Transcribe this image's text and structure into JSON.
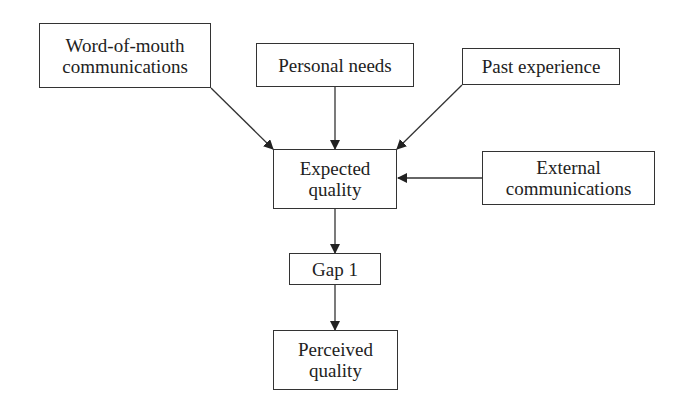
{
  "diagram": {
    "title": "",
    "colors": {
      "stroke": "#333333",
      "text": "#222222",
      "background": "#ffffff"
    },
    "nodes": {
      "word_of_mouth": {
        "label": "Word-of-mouth\ncommunications"
      },
      "personal_needs": {
        "label": "Personal needs"
      },
      "past_experience": {
        "label": "Past experience"
      },
      "expected_quality": {
        "label": "Expected\nquality"
      },
      "external_communications": {
        "label": "External\ncommunications"
      },
      "gap1": {
        "label": "Gap 1"
      },
      "perceived_quality": {
        "label": "Perceived\nquality"
      }
    },
    "edges": [
      {
        "from": "Word-of-mouth communications",
        "to": "Expected quality"
      },
      {
        "from": "Personal needs",
        "to": "Expected quality"
      },
      {
        "from": "Past experience",
        "to": "Expected quality"
      },
      {
        "from": "External communications",
        "to": "Expected quality"
      },
      {
        "from": "Expected quality",
        "to": "Gap 1"
      },
      {
        "from": "Gap 1",
        "to": "Perceived quality"
      }
    ]
  }
}
